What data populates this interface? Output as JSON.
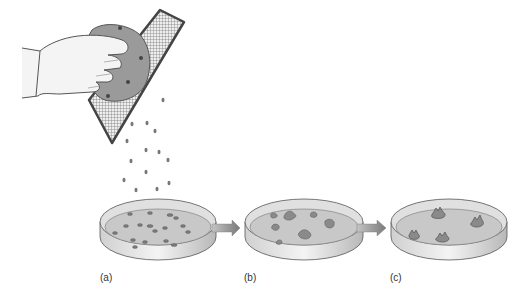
{
  "figure": {
    "panels": [
      {
        "id": "a",
        "label": "(a)",
        "state": "small scattered crumbs"
      },
      {
        "id": "b",
        "label": "(b)",
        "state": "larger irregular aggregates"
      },
      {
        "id": "c",
        "label": "(c)",
        "state": "raised clustered aggregates"
      }
    ],
    "arrows": [
      {
        "from": "a",
        "to": "b"
      },
      {
        "from": "b",
        "to": "c"
      }
    ],
    "colors": {
      "outline": "#555555",
      "dish_rim": "#dcdcdc",
      "dish_inner": "#c8c8c8",
      "particle": "#7a7a7a",
      "arrow": "#8a8a8a",
      "mesh": "#6b6b6b",
      "hand": "#f4f4f4"
    }
  }
}
